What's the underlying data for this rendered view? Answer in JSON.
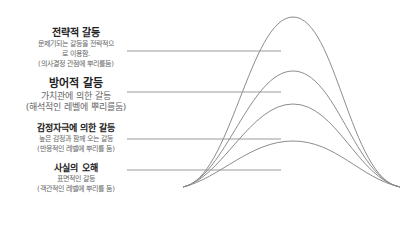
{
  "levels": [
    {
      "title": "전략적 갈등",
      "lines": [
        "문제기되는 갈등을 전략적으",
        "로 이용함.",
        "(의사결정 관점에 뿌리를둠)"
      ]
    },
    {
      "title": "방어적 갈등",
      "lines": [
        "가치관에 의한 갈등",
        "(해석적인 레벨에 뿌리를둠)"
      ]
    },
    {
      "title": "감정자극에 의한 갈등",
      "lines": [
        "높은 감정과 함께 오는 갈등",
        "(반응적인 레벨에 뿌리를 둠)"
      ]
    },
    {
      "title": "사실의 오해",
      "lines": [
        "표면적인 갈등",
        "(객관적인 레벨에 뿌리를 둠)"
      ]
    }
  ],
  "colors": {
    "line": "#9a9a9a",
    "curve": "#8c8c8c"
  }
}
